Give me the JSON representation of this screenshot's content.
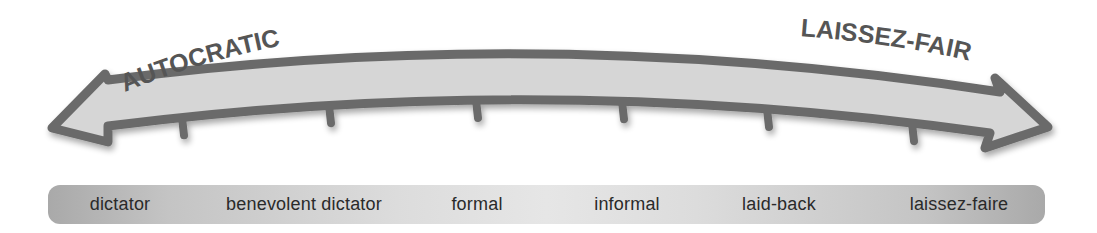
{
  "headings": {
    "left": "AUTOCRATIC",
    "right": "LAISSEZ-FAIRE"
  },
  "scale": {
    "labels": [
      "dictator",
      "benevolent dictator",
      "formal",
      "informal",
      "laid-back",
      "laissez-faire"
    ]
  },
  "colors": {
    "arrow_outline": "#6b6b6b",
    "arrow_fill": "#d6d6d6",
    "heading_text": "#555555",
    "label_text": "#2a2a2a",
    "bar_edge": "#a9a9a9",
    "bar_center": "#e6e6e6"
  }
}
